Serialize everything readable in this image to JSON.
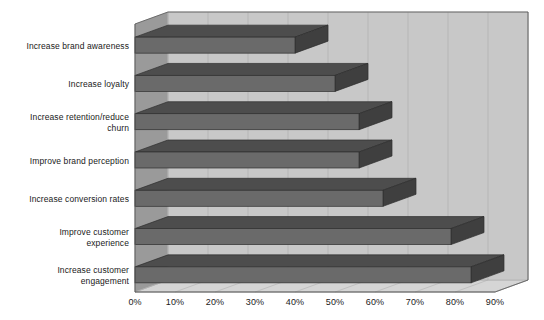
{
  "chart_data": {
    "type": "bar",
    "orientation": "horizontal",
    "title": "",
    "subtitle": "",
    "xlabel": "",
    "ylabel": "",
    "xlim": [
      0,
      90
    ],
    "grid": true,
    "legend": false,
    "style": "3d",
    "categories": [
      "Increase brand awareness",
      "Increase loyalty",
      "Increase retention/reduce\nchurn",
      "Improve brand perception",
      "Increase conversion rates",
      "Improve customer\nexperience",
      "Increase customer\nengagement"
    ],
    "values": [
      40,
      50,
      56,
      56,
      62,
      79,
      84
    ],
    "tick_labels": [
      "0%",
      "10%",
      "20%",
      "30%",
      "40%",
      "50%",
      "60%",
      "70%",
      "80%",
      "90%"
    ],
    "tick_values": [
      0,
      10,
      20,
      30,
      40,
      50,
      60,
      70,
      80,
      90
    ],
    "colors": {
      "bar_front": "#6a6a6a",
      "bar_top": "#4d4d4d",
      "bar_side": "#3f3f3f",
      "floor": "#d5d5d5",
      "back_wall": "#c8c8c8",
      "left_wall": "#9a9a9a",
      "gridline": "#b0b0b0",
      "axis": "#555555",
      "text": "#1a1a1a",
      "background": "#ffffff"
    }
  }
}
